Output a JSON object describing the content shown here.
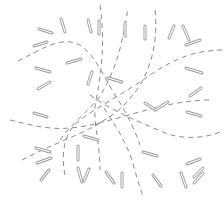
{
  "canvas": {
    "width": 224,
    "height": 206,
    "background": "#ffffff"
  },
  "colors": {
    "stroke": "#9a9a9a",
    "dash": "#8c8c8c"
  },
  "dashed_curves": [
    {
      "d": "M18,61 C40,50 55,40 70,42 C90,44 100,70 115,95 C125,110 135,130 140,145"
    },
    {
      "d": "M10,120 C30,125 50,130 70,128 C110,125 160,100 210,100"
    },
    {
      "d": "M65,175 C60,150 66,130 80,120 C100,105 130,90 150,75 C170,62 190,50 224,50"
    },
    {
      "d": "M60,140 C70,125 90,110 100,96 C110,80 118,60 122,40 C126,25 127,12 128,8"
    },
    {
      "d": "M90,95 C110,110 135,120 165,133 C185,140 205,138 220,132"
    },
    {
      "d": "M100,5 C105,40 102,70 96,100 C92,120 100,140 100,170"
    },
    {
      "d": "M104,108 C115,125 125,140 132,160 C136,175 140,188 143,196"
    },
    {
      "d": "M22,160 C50,145 80,135 100,123"
    },
    {
      "d": "M155,10 C158,40 152,65 140,85 C125,108 110,118 95,125"
    }
  ],
  "segments": [
    {
      "x1": 39,
      "y1": 29,
      "x2": 52,
      "y2": 33
    },
    {
      "x1": 61,
      "y1": 19,
      "x2": 65,
      "y2": 32
    },
    {
      "x1": 88,
      "y1": 20,
      "x2": 91,
      "y2": 32
    },
    {
      "x1": 99,
      "y1": 21,
      "x2": 99,
      "y2": 34
    },
    {
      "x1": 125,
      "y1": 23,
      "x2": 125,
      "y2": 36
    },
    {
      "x1": 145,
      "y1": 26,
      "x2": 145,
      "y2": 39
    },
    {
      "x1": 174,
      "y1": 26,
      "x2": 169,
      "y2": 38
    },
    {
      "x1": 183,
      "y1": 26,
      "x2": 189,
      "y2": 40
    },
    {
      "x1": 186,
      "y1": 45,
      "x2": 200,
      "y2": 40
    },
    {
      "x1": 34,
      "y1": 46,
      "x2": 47,
      "y2": 42
    },
    {
      "x1": 36,
      "y1": 68,
      "x2": 50,
      "y2": 72
    },
    {
      "x1": 38,
      "y1": 89,
      "x2": 50,
      "y2": 82
    },
    {
      "x1": 67,
      "y1": 63,
      "x2": 81,
      "y2": 59
    },
    {
      "x1": 88,
      "y1": 84,
      "x2": 92,
      "y2": 72
    },
    {
      "x1": 108,
      "y1": 78,
      "x2": 122,
      "y2": 82
    },
    {
      "x1": 186,
      "y1": 68,
      "x2": 202,
      "y2": 73
    },
    {
      "x1": 190,
      "y1": 96,
      "x2": 201,
      "y2": 88
    },
    {
      "x1": 145,
      "y1": 103,
      "x2": 156,
      "y2": 110
    },
    {
      "x1": 155,
      "y1": 110,
      "x2": 168,
      "y2": 102
    },
    {
      "x1": 187,
      "y1": 112,
      "x2": 201,
      "y2": 116
    },
    {
      "x1": 34,
      "y1": 113,
      "x2": 47,
      "y2": 117
    },
    {
      "x1": 84,
      "y1": 136,
      "x2": 98,
      "y2": 140
    },
    {
      "x1": 143,
      "y1": 152,
      "x2": 157,
      "y2": 156
    },
    {
      "x1": 187,
      "y1": 164,
      "x2": 200,
      "y2": 159
    },
    {
      "x1": 36,
      "y1": 148,
      "x2": 50,
      "y2": 152
    },
    {
      "x1": 37,
      "y1": 163,
      "x2": 51,
      "y2": 158
    },
    {
      "x1": 41,
      "y1": 180,
      "x2": 49,
      "y2": 170
    },
    {
      "x1": 78,
      "y1": 146,
      "x2": 78,
      "y2": 160
    },
    {
      "x1": 78,
      "y1": 168,
      "x2": 82,
      "y2": 182
    },
    {
      "x1": 84,
      "y1": 181,
      "x2": 89,
      "y2": 169
    },
    {
      "x1": 106,
      "y1": 172,
      "x2": 114,
      "y2": 183
    },
    {
      "x1": 122,
      "y1": 173,
      "x2": 122,
      "y2": 187
    },
    {
      "x1": 153,
      "y1": 175,
      "x2": 161,
      "y2": 186
    },
    {
      "x1": 181,
      "y1": 173,
      "x2": 186,
      "y2": 187
    },
    {
      "x1": 194,
      "y1": 177,
      "x2": 203,
      "y2": 168
    },
    {
      "x1": 194,
      "y1": 183,
      "x2": 203,
      "y2": 173
    }
  ]
}
